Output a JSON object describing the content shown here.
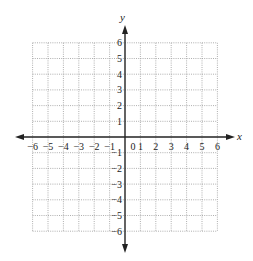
{
  "chart_data": {
    "type": "coordinate-grid",
    "title": "",
    "xlabel": "x",
    "ylabel": "y",
    "xlim": [
      -6,
      6
    ],
    "ylim": [
      -6,
      6
    ],
    "grid": true,
    "grid_style": "dotted",
    "x_ticks": [
      "−6",
      "−5",
      "−4",
      "−3",
      "−2",
      "−1",
      "0",
      "1",
      "2",
      "3",
      "4",
      "5",
      "6"
    ],
    "y_ticks": [
      "6",
      "5",
      "4",
      "3",
      "2",
      "1",
      "−1",
      "−2",
      "−3",
      "−4",
      "−5",
      "−6"
    ],
    "x_tick_values": [
      -6,
      -5,
      -4,
      -3,
      -2,
      -1,
      0,
      1,
      2,
      3,
      4,
      5,
      6
    ],
    "y_tick_values": [
      6,
      5,
      4,
      3,
      2,
      1,
      -1,
      -2,
      -3,
      -4,
      -5,
      -6
    ],
    "series": [],
    "axis_color": "#222222",
    "grid_color": "#9a9a9a"
  },
  "axes": {
    "x_label": "x",
    "y_label": "y"
  }
}
